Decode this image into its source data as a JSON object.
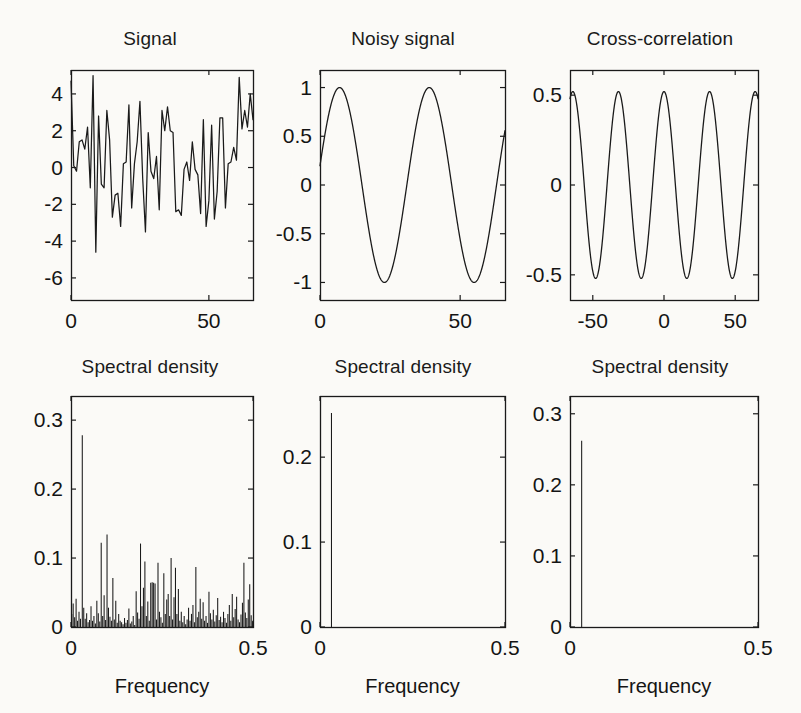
{
  "figure": {
    "background": "#fbfaf7",
    "ink": "#1a1a1a",
    "rows": 2,
    "cols": 3
  },
  "panels": {
    "signal": {
      "title": "Signal",
      "xticks": [
        "0",
        "50"
      ],
      "yticks": [
        "4",
        "2",
        "0",
        "-2",
        "-4",
        "-6"
      ],
      "xlabel": ""
    },
    "noisy": {
      "title": "Noisy signal",
      "xticks": [
        "0",
        "50"
      ],
      "yticks": [
        "1",
        "0.5",
        "0",
        "-0.5",
        "-1"
      ],
      "xlabel": ""
    },
    "xcorr": {
      "title": "Cross-correlation",
      "xticks": [
        "-50",
        "0",
        "50"
      ],
      "yticks": [
        "0.5",
        "0",
        "-0.5"
      ],
      "xlabel": ""
    },
    "psd1": {
      "title": "Spectral density",
      "xticks": [
        "0",
        "0.5"
      ],
      "yticks": [
        "0.3",
        "0.2",
        "0.1",
        "0"
      ],
      "xlabel": "Frequency"
    },
    "psd2": {
      "title": "Spectral density",
      "xticks": [
        "0",
        "0.5"
      ],
      "yticks": [
        "0.2",
        "0.1",
        "0"
      ],
      "xlabel": "Frequency"
    },
    "psd3": {
      "title": "Spectral density",
      "xticks": [
        "0",
        "0.5"
      ],
      "yticks": [
        "0.3",
        "0.2",
        "0.1",
        "0"
      ],
      "xlabel": "Frequency"
    }
  },
  "chart_data": [
    {
      "id": "signal",
      "type": "line",
      "title": "Signal",
      "xlabel": "",
      "ylabel": "",
      "xlim": [
        0,
        66
      ],
      "ylim": [
        -7.2,
        5.3
      ],
      "xticks": [
        0,
        50
      ],
      "yticks": [
        4,
        2,
        0,
        -2,
        -4,
        -6
      ],
      "grid": false,
      "legend": null,
      "x": [
        0,
        1,
        2,
        3,
        4,
        5,
        6,
        7,
        8,
        9,
        10,
        11,
        12,
        13,
        14,
        15,
        16,
        17,
        18,
        19,
        20,
        21,
        22,
        23,
        24,
        25,
        26,
        27,
        28,
        29,
        30,
        31,
        32,
        33,
        34,
        35,
        36,
        37,
        38,
        39,
        40,
        41,
        42,
        43,
        44,
        45,
        46,
        47,
        48,
        49,
        50,
        51,
        52,
        53,
        54,
        55,
        56,
        57,
        58,
        59,
        60,
        61,
        62,
        63,
        64,
        65,
        66
      ],
      "values": [
        4.7,
        0.1,
        -0.2,
        1.4,
        1.5,
        1.0,
        2.2,
        -1.1,
        5.0,
        -4.6,
        2.8,
        -0.9,
        -1.1,
        3.1,
        1.5,
        -2.7,
        -1.5,
        -1.4,
        -3.2,
        0.2,
        0.3,
        3.4,
        -2.2,
        0.2,
        1.4,
        3.6,
        -0.6,
        -3.5,
        1.9,
        -0.2,
        -0.6,
        0.6,
        -2.3,
        3.1,
        2.0,
        3.3,
        2.0,
        1.9,
        -2.4,
        -2.3,
        -2.6,
        -0.1,
        0.3,
        -0.7,
        1.4,
        -0.1,
        -0.4,
        -2.5,
        2.6,
        -3.2,
        -1.8,
        2.3,
        -2.8,
        -1.3,
        2.7,
        2.7,
        -2.2,
        0.2,
        0.3,
        1.1,
        0.4,
        4.9,
        2.1,
        3.1,
        2.2,
        4.0,
        2.6
      ]
    },
    {
      "id": "noisy",
      "type": "line",
      "title": "Noisy signal",
      "xlabel": "",
      "ylabel": "",
      "xlim": [
        0,
        66
      ],
      "ylim": [
        -1.18,
        1.18
      ],
      "xticks": [
        0,
        50
      ],
      "yticks": [
        1,
        0.5,
        0,
        -0.5,
        -1
      ],
      "grid": false,
      "legend": null,
      "description": "sin wave, period approx 32 samples, amplitude 1, phase offset so value at x=0 is about 0.2",
      "formula": "y = sin(2*pi*x/32 + 0.2)",
      "period": 32,
      "amplitude": 1.0,
      "phase": 0.2
    },
    {
      "id": "xcorr",
      "type": "line",
      "title": "Cross-correlation",
      "xlabel": "",
      "ylabel": "",
      "xlim": [
        -66,
        66
      ],
      "ylim": [
        -0.64,
        0.64
      ],
      "xticks": [
        -50,
        0,
        50
      ],
      "yticks": [
        0.5,
        0,
        -0.5
      ],
      "grid": false,
      "legend": null,
      "description": "cosine of lag, peak 0.52 at lag 0, period approx 32 lags",
      "formula": "y = 0.52*cos(2*pi*lag/32)",
      "period": 32,
      "amplitude": 0.52
    },
    {
      "id": "psd1",
      "type": "bar",
      "title": "Spectral density",
      "xlabel": "Frequency",
      "ylabel": "",
      "xlim": [
        0,
        0.5
      ],
      "ylim": [
        0,
        0.335
      ],
      "xticks": [
        0,
        0.5
      ],
      "yticks": [
        0.3,
        0.2,
        0.1,
        0
      ],
      "grid": false,
      "legend": null,
      "peak": {
        "frequency": 0.031,
        "value": 0.278
      },
      "frequencies": [
        0.002,
        0.006,
        0.01,
        0.014,
        0.018,
        0.022,
        0.026,
        0.031,
        0.035,
        0.039,
        0.043,
        0.047,
        0.051,
        0.055,
        0.059,
        0.063,
        0.067,
        0.071,
        0.075,
        0.079,
        0.083,
        0.087,
        0.091,
        0.095,
        0.099,
        0.103,
        0.107,
        0.111,
        0.115,
        0.119,
        0.123,
        0.127,
        0.131,
        0.135,
        0.139,
        0.143,
        0.147,
        0.151,
        0.155,
        0.159,
        0.163,
        0.167,
        0.171,
        0.175,
        0.179,
        0.183,
        0.187,
        0.191,
        0.195,
        0.199,
        0.203,
        0.207,
        0.211,
        0.215,
        0.219,
        0.223,
        0.227,
        0.231,
        0.235,
        0.239,
        0.243,
        0.247,
        0.251,
        0.255,
        0.259,
        0.263,
        0.267,
        0.271,
        0.275,
        0.279,
        0.283,
        0.287,
        0.291,
        0.295,
        0.299,
        0.303,
        0.307,
        0.311,
        0.315,
        0.319,
        0.323,
        0.327,
        0.331,
        0.335,
        0.339,
        0.343,
        0.347,
        0.351,
        0.355,
        0.359,
        0.363,
        0.367,
        0.371,
        0.375,
        0.379,
        0.383,
        0.387,
        0.391,
        0.395,
        0.399,
        0.403,
        0.407,
        0.411,
        0.415,
        0.419,
        0.423,
        0.427,
        0.431,
        0.435,
        0.439,
        0.443,
        0.447,
        0.451,
        0.455,
        0.459,
        0.463,
        0.467,
        0.471,
        0.475,
        0.479,
        0.483,
        0.487,
        0.491,
        0.495,
        0.499
      ],
      "values": [
        0.019,
        0.034,
        0.014,
        0.041,
        0.009,
        0.022,
        0.012,
        0.278,
        0.028,
        0.012,
        0.02,
        0.007,
        0.01,
        0.03,
        0.009,
        0.016,
        0.005,
        0.038,
        0.02,
        0.008,
        0.122,
        0.016,
        0.046,
        0.01,
        0.134,
        0.028,
        0.015,
        0.009,
        0.071,
        0.011,
        0.038,
        0.006,
        0.019,
        0.009,
        0.007,
        0.004,
        0.013,
        0.006,
        0.01,
        0.027,
        0.005,
        0.008,
        0.016,
        0.003,
        0.052,
        0.021,
        0.012,
        0.121,
        0.03,
        0.057,
        0.095,
        0.016,
        0.037,
        0.009,
        0.064,
        0.065,
        0.064,
        0.063,
        0.011,
        0.093,
        0.022,
        0.014,
        0.006,
        0.078,
        0.019,
        0.04,
        0.048,
        0.016,
        0.1,
        0.011,
        0.043,
        0.086,
        0.019,
        0.055,
        0.009,
        0.022,
        0.007,
        0.016,
        0.004,
        0.011,
        0.028,
        0.009,
        0.019,
        0.032,
        0.007,
        0.087,
        0.014,
        0.022,
        0.041,
        0.012,
        0.036,
        0.009,
        0.016,
        0.006,
        0.051,
        0.02,
        0.011,
        0.025,
        0.008,
        0.017,
        0.042,
        0.01,
        0.015,
        0.007,
        0.022,
        0.013,
        0.006,
        0.019,
        0.032,
        0.009,
        0.048,
        0.014,
        0.026,
        0.044,
        0.011,
        0.007,
        0.018,
        0.035,
        0.093,
        0.021,
        0.013,
        0.04,
        0.062,
        0.017,
        0.009
      ]
    },
    {
      "id": "psd2",
      "type": "bar",
      "title": "Spectral density",
      "xlabel": "Frequency",
      "ylabel": "",
      "xlim": [
        0,
        0.5
      ],
      "ylim": [
        0,
        0.272
      ],
      "xticks": [
        0,
        0.5
      ],
      "yticks": [
        0.2,
        0.1,
        0
      ],
      "grid": false,
      "legend": null,
      "peak": {
        "frequency": 0.031,
        "value": 0.252
      },
      "frequencies": [
        0.031
      ],
      "values": [
        0.252
      ]
    },
    {
      "id": "psd3",
      "type": "bar",
      "title": "Spectral density",
      "xlabel": "Frequency",
      "ylabel": "",
      "xlim": [
        0,
        0.5
      ],
      "ylim": [
        0,
        0.325
      ],
      "xticks": [
        0,
        0.5
      ],
      "yticks": [
        0.3,
        0.2,
        0.1,
        0
      ],
      "grid": false,
      "legend": null,
      "peak": {
        "frequency": 0.031,
        "value": 0.262
      },
      "frequencies": [
        0.031
      ],
      "values": [
        0.262
      ]
    }
  ]
}
